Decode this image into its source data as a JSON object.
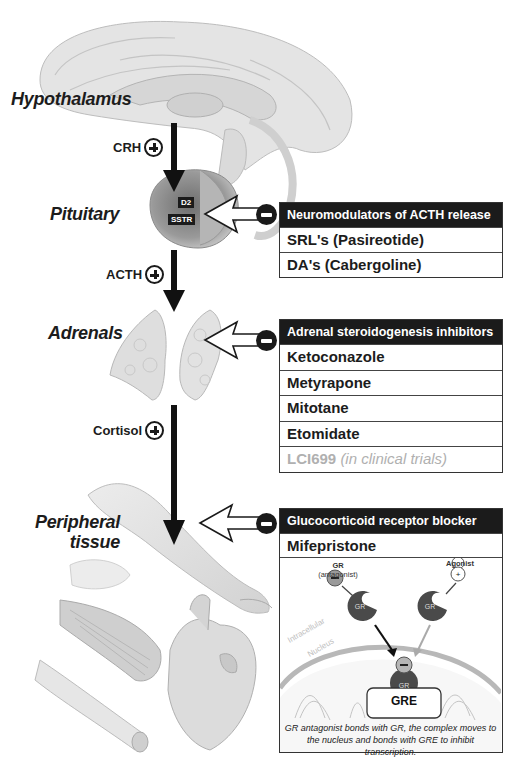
{
  "organs": {
    "hypothalamus": "Hypothalamus",
    "pituitary": "Pituitary",
    "adrenals": "Adrenals",
    "peripheral": [
      "Peripheral",
      "tissue"
    ]
  },
  "hormones": {
    "crh": "CRH",
    "acth": "ACTH",
    "cortisol": "Cortisol"
  },
  "receptors": {
    "d2": "D2",
    "sstr": "SSTR"
  },
  "boxes": {
    "neuromodulators": {
      "title": "Neuromodulators of ACTH release",
      "items": [
        "SRL's (Pasireotide)",
        "DA's (Cabergoline)"
      ]
    },
    "adrenal": {
      "title": "Adrenal steroidogenesis inhibitors",
      "items": [
        "Ketoconazole",
        "Metyrapone",
        "Mitotane",
        "Etomidate"
      ],
      "trial_item": "LCI699",
      "trial_note": "(in clinical trials)"
    },
    "gr_blocker": {
      "title": "Glucocorticoid receptor blocker",
      "items": [
        "Mifepristone"
      ],
      "diagram": {
        "antagonist_label": [
          "GR",
          "(antagonist)"
        ],
        "agonist_label": "Agonist",
        "gr": "GR",
        "gre": "GRE",
        "intracellular": "Intracellular",
        "nucleus": "Nucleus",
        "caption": [
          "GR antagonist bonds with GR, the complex moves to",
          "the nucleus and bonds with GRE to inhibit transcription."
        ]
      }
    }
  },
  "colors": {
    "header_bg": "#1b1b1b",
    "trial_text": "#b0b0b0",
    "gr_fill": "#4a4a4a"
  }
}
